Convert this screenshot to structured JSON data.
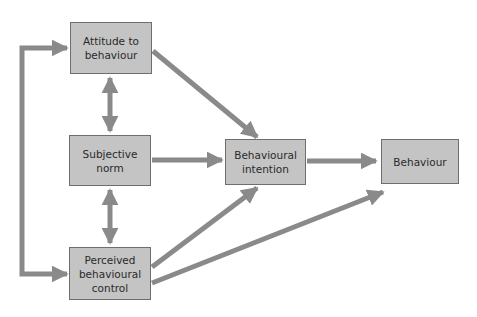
{
  "diagram": {
    "title": "",
    "colors": {
      "box_fill": "#c4c4c4",
      "box_border": "#6e6e6e",
      "arrow": "#8a8a8a",
      "text": "#2a2a2a"
    },
    "nodes": [
      {
        "id": "attitude",
        "label": "Attitude to\nbehaviour"
      },
      {
        "id": "norm",
        "label": "Subjective\nnorm"
      },
      {
        "id": "pbc",
        "label": "Perceived\nbehavioural\ncontrol"
      },
      {
        "id": "intention",
        "label": "Behavioural\nintention"
      },
      {
        "id": "behaviour",
        "label": "Behaviour"
      }
    ],
    "edges": [
      {
        "from": "attitude",
        "to": "intention",
        "type": "directed"
      },
      {
        "from": "norm",
        "to": "intention",
        "type": "directed"
      },
      {
        "from": "pbc",
        "to": "intention",
        "type": "directed"
      },
      {
        "from": "pbc",
        "to": "behaviour",
        "type": "directed"
      },
      {
        "from": "intention",
        "to": "behaviour",
        "type": "directed"
      },
      {
        "from": "attitude",
        "to": "norm",
        "type": "bidirectional"
      },
      {
        "from": "norm",
        "to": "pbc",
        "type": "bidirectional"
      },
      {
        "from": "attitude",
        "to": "pbc",
        "type": "bidirectional-loop"
      }
    ]
  }
}
